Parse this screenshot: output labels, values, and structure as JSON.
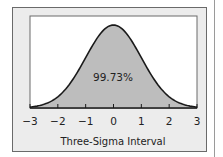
{
  "chart_data": {
    "type": "area",
    "title": "",
    "xlabel": "Three-Sigma Interval",
    "ylabel": "",
    "x_ticks": [
      "−3",
      "−2",
      "−1",
      "0",
      "1",
      "2",
      "3"
    ],
    "xlim": [
      -3,
      3
    ],
    "series": [
      {
        "name": "Normal distribution",
        "shaded_range": [
          -3,
          3
        ],
        "annotation": "99.73%"
      }
    ],
    "grid": false,
    "legend": "none",
    "colors": {
      "fill": "#bdbdbd",
      "line": "#1a1a1a",
      "panel": "#ececec",
      "plot_bg": "#ffffff"
    }
  },
  "labels": {
    "annotation": "99.73%",
    "xlabel": "Three-Sigma Interval",
    "ticks": [
      "−3",
      "−2",
      "−1",
      "0",
      "1",
      "2",
      "3"
    ]
  }
}
